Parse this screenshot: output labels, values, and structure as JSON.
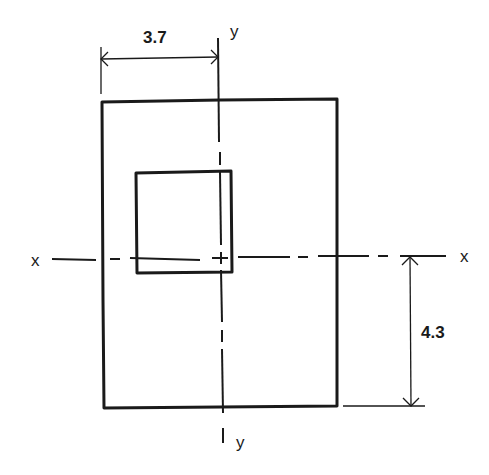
{
  "diagram": {
    "type": "cross-section-with-opening",
    "stroke_color": "#1a1a1a",
    "background_color": "#ffffff",
    "axes": {
      "x": {
        "label_left": "x",
        "label_right": "x"
      },
      "y": {
        "label_top": "y",
        "label_bottom": "y"
      }
    },
    "dimensions": {
      "horizontal": {
        "value": "3.7",
        "description": "distance from left edge of outer rectangle to y-axis"
      },
      "vertical": {
        "value": "4.3",
        "description": "distance from bottom edge of outer rectangle to x-axis"
      }
    },
    "shapes": {
      "outer_rectangle": {
        "description": "outer section boundary"
      },
      "inner_rectangle": {
        "description": "rectangular opening / hole"
      }
    }
  }
}
